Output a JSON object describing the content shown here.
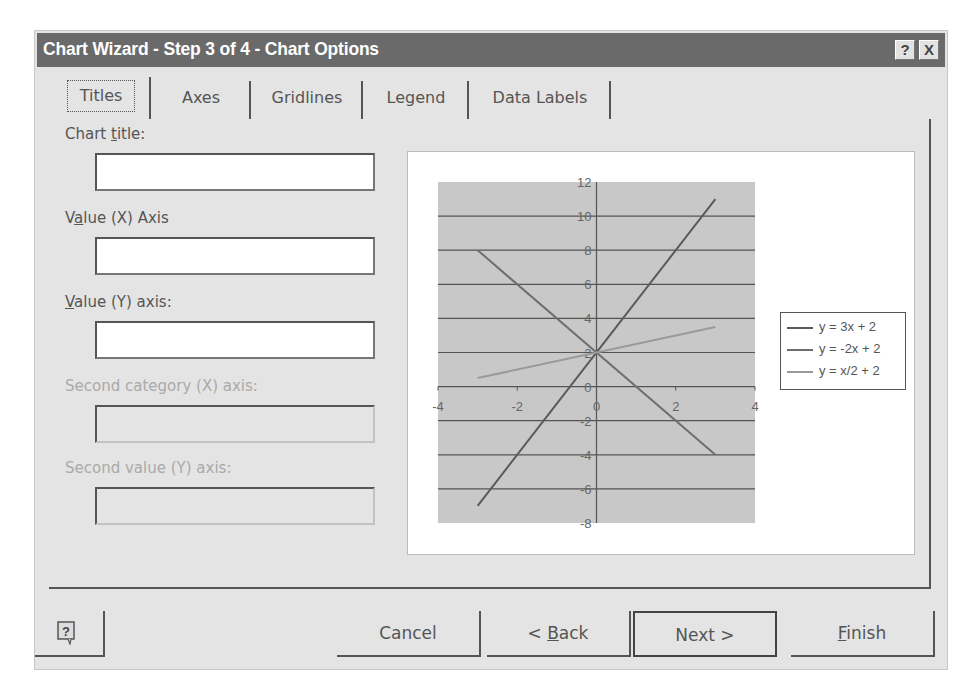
{
  "window": {
    "title": "Chart Wizard - Step 3 of 4 - Chart Options",
    "help_button": "?",
    "close_button": "X"
  },
  "tabs": [
    {
      "label": "Titles",
      "active": true
    },
    {
      "label": "Axes",
      "active": false
    },
    {
      "label": "Gridlines",
      "active": false
    },
    {
      "label": "Legend",
      "active": false
    },
    {
      "label": "Data Labels",
      "active": false
    }
  ],
  "fields": [
    {
      "label_pre": "Chart ",
      "label_u": "t",
      "label_post": "itle:",
      "value": "",
      "enabled": true
    },
    {
      "label_pre": "V",
      "label_u": "a",
      "label_post": "lue (X) Axis",
      "value": "",
      "enabled": true
    },
    {
      "label_pre": "",
      "label_u": "V",
      "label_post": "alue (Y) axis:",
      "value": "",
      "enabled": true
    },
    {
      "label_pre": "Second category (X) axis:",
      "label_u": "",
      "label_post": "",
      "value": "",
      "enabled": false
    },
    {
      "label_pre": "Second value (Y) axis:",
      "label_u": "",
      "label_post": "",
      "value": "",
      "enabled": false
    }
  ],
  "buttons": {
    "help_icon": "help-balloon-icon",
    "cancel": "Cancel",
    "back_pre": "< ",
    "back_u": "B",
    "back_post": "ack",
    "next": "Next >",
    "finish_u": "F",
    "finish_post": "inish"
  },
  "colors": {
    "title_bar": "#6a6a6a",
    "dialog_bg": "#e4e4e4",
    "plot_area": "#c8c8c8",
    "series_1": "#5a5a5a",
    "series_2": "#6e6e6e",
    "series_3": "#9a9a9a"
  },
  "chart_data": {
    "type": "scatter",
    "title": "",
    "xlabel": "",
    "ylabel": "",
    "xlim": [
      -4,
      4
    ],
    "ylim": [
      -8,
      12
    ],
    "x_ticks": [
      "-4",
      "-2",
      "0",
      "2",
      "4"
    ],
    "y_ticks": [
      "-8",
      "-6",
      "-4",
      "-2",
      "0",
      "2",
      "4",
      "6",
      "8",
      "10",
      "12"
    ],
    "grid": "horizontal major gridlines",
    "legend_position": "right",
    "series": [
      {
        "name": "y = 3x + 2",
        "x": [
          -3,
          3
        ],
        "y": [
          -7,
          11
        ]
      },
      {
        "name": "y = -2x + 2",
        "x": [
          -3,
          3
        ],
        "y": [
          8,
          -4
        ]
      },
      {
        "name": "y = x/2 + 2",
        "x": [
          -3,
          3
        ],
        "y": [
          0.5,
          3.5
        ]
      }
    ]
  }
}
